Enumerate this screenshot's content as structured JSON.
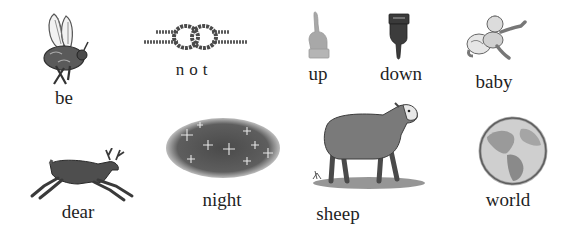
{
  "rebus": {
    "items": [
      {
        "word": "be",
        "picture": "bee-icon"
      },
      {
        "word": "not",
        "picture": "knot-icon"
      },
      {
        "word": "up",
        "picture": "hand-pointing-up-icon"
      },
      {
        "word": "down",
        "picture": "hand-pointing-down-icon"
      },
      {
        "word": "baby",
        "picture": "crawling-baby-icon"
      },
      {
        "word": "dear",
        "picture": "deer-icon"
      },
      {
        "word": "night",
        "picture": "starry-night-icon"
      },
      {
        "word": "sheep",
        "picture": "sheep-icon"
      },
      {
        "word": "world",
        "picture": "globe-icon"
      }
    ]
  },
  "colors": {
    "background": "#ffffff",
    "text": "#1f1f1f",
    "ink_dark": "#3a3a3a",
    "ink_light": "#9a9a9a"
  }
}
